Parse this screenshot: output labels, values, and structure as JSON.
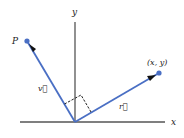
{
  "diagram": {
    "axes": {
      "x_label": "x",
      "y_label": "y"
    },
    "points": {
      "p_label": "P",
      "xy_label": "(x, y)"
    },
    "vectors": {
      "v_label": "v⃗",
      "r_label": "r⃗"
    },
    "colors": {
      "vector": "#4a6fc4",
      "axis": "#555555",
      "arrowhead": "#111111",
      "right_angle": "#222222"
    }
  }
}
